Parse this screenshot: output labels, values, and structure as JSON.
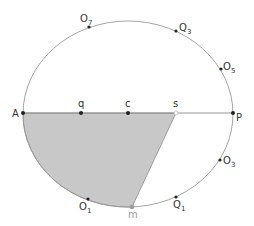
{
  "diagram": {
    "type": "ellipse-geometry",
    "ellipse": {
      "cx": 128,
      "cy": 114,
      "rx": 105,
      "ry": 93,
      "stroke": "#9a9a9a"
    },
    "diameter": {
      "from": "A",
      "to": "P"
    },
    "shaded_region": {
      "fill": "#c8c8c8",
      "stroke": "#8a8a8a",
      "vertices": [
        "A",
        "s",
        "m"
      ],
      "arc": "m to A along lower ellipse"
    },
    "points": {
      "A": {
        "label": "A",
        "sub": "",
        "x": 23,
        "y": 113
      },
      "q": {
        "label": "q",
        "sub": "",
        "x": 81,
        "y": 113
      },
      "c": {
        "label": "c",
        "sub": "",
        "x": 128,
        "y": 113
      },
      "s": {
        "label": "s",
        "sub": "",
        "x": 176,
        "y": 113
      },
      "P": {
        "label": "P",
        "sub": "",
        "x": 233,
        "y": 113
      },
      "O7": {
        "label": "O",
        "sub": "7",
        "x": 89,
        "y": 27
      },
      "Q3": {
        "label": "Q",
        "sub": "3",
        "x": 176,
        "y": 31
      },
      "O5": {
        "label": "O",
        "sub": "5",
        "x": 221,
        "y": 69
      },
      "O3": {
        "label": "O",
        "sub": "3",
        "x": 220,
        "y": 160
      },
      "Q1": {
        "label": "Q",
        "sub": "1",
        "x": 176,
        "y": 197
      },
      "O1": {
        "label": "O",
        "sub": "1",
        "x": 88,
        "y": 199
      },
      "m": {
        "label": "m",
        "sub": "",
        "x": 132,
        "y": 207
      }
    }
  }
}
